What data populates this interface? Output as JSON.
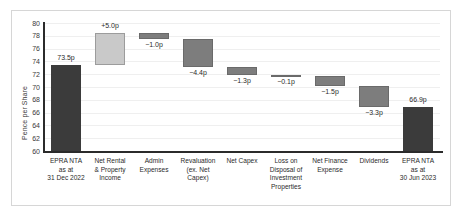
{
  "chart_data": {
    "type": "bar",
    "chart_subtype": "waterfall",
    "title": "",
    "xlabel": "",
    "ylabel": "Pence per Share",
    "ylim": [
      60,
      80
    ],
    "ytick_step": 2,
    "ytick_labels": [
      "80",
      "78",
      "76",
      "74",
      "72",
      "70",
      "68",
      "66",
      "64",
      "62",
      "60"
    ],
    "grid": true,
    "legend": "none",
    "unit": "p",
    "categories": [
      "EPRA NTA as at 31 Dec 2022",
      "Net Rental & Property Income",
      "Admin Expenses",
      "Revaluation (ex. Net Capex)",
      "Net Capex",
      "Loss on Disposal of Investment Properties",
      "Net Finance Expense",
      "Dividends",
      "EPRA NTA as at 30 Jun 2023"
    ],
    "category_lines": [
      [
        "EPRA NTA",
        "as at",
        "31 Dec 2022"
      ],
      [
        "Net Rental",
        "& Property",
        "Income"
      ],
      [
        "Admin",
        "Expenses"
      ],
      [
        "Revaluation",
        "(ex. Net",
        "Capex)"
      ],
      [
        "Net Capex"
      ],
      [
        "Loss on",
        "Disposal of",
        "Investment",
        "Properties"
      ],
      [
        "Net Finance",
        "Expense"
      ],
      [
        "Dividends"
      ],
      [
        "EPRA NTA",
        "as at",
        "30 Jun 2023"
      ]
    ],
    "data_labels": [
      "73.5p",
      "+5.0p",
      "−1.0p",
      "−4.4p",
      "−1.3p",
      "−0.1p",
      "−1.5p",
      "−3.3p",
      "66.9p"
    ],
    "values": [
      73.5,
      5.0,
      -1.0,
      -4.4,
      -1.3,
      -0.1,
      -1.5,
      -3.3,
      66.9
    ],
    "bar_bases": [
      60.0,
      73.5,
      77.5,
      73.1,
      71.8,
      71.7,
      70.2,
      66.9,
      60.0
    ],
    "bar_tops": [
      73.5,
      78.5,
      78.5,
      77.5,
      73.1,
      71.8,
      71.7,
      70.2,
      66.9
    ],
    "bar_kinds": [
      "total",
      "increase",
      "decrease",
      "decrease",
      "decrease",
      "decrease",
      "decrease",
      "decrease",
      "total"
    ],
    "label_positions": [
      "above",
      "above",
      "below",
      "below",
      "below",
      "below",
      "below",
      "below",
      "above"
    ],
    "colors": {
      "total": "#3b3b3b",
      "increase": "#c9c9c9",
      "decrease": "#7d7d7d",
      "axis": "#2b2b2b",
      "grid": "#efefef",
      "text": "#2b2b2b",
      "frame": "#d6d6d6",
      "background": "#ffffff"
    }
  }
}
